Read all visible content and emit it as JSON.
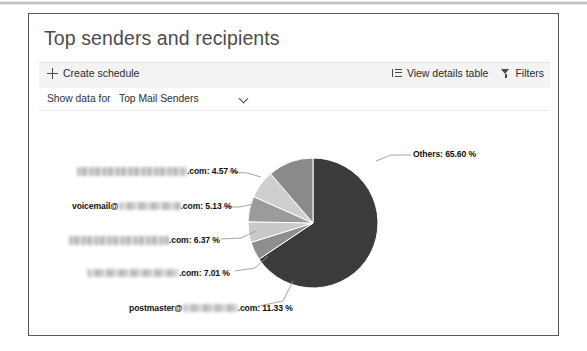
{
  "card": {
    "title": "Top senders and recipients"
  },
  "toolbar": {
    "create_schedule_label": "Create schedule",
    "view_details_label": "View details table",
    "filters_label": "Filters",
    "plus_icon": "plus-icon",
    "list_icon": "list-icon",
    "funnel_icon": "funnel-icon"
  },
  "filter_row": {
    "label": "Show data for",
    "selected": "Top Mail Senders",
    "chevron_icon": "chevron-down-icon",
    "options": [
      "Top Mail Senders"
    ]
  },
  "chart_data": {
    "type": "pie",
    "title": "Top senders and recipients",
    "legend": "labels-with-leader-lines",
    "grid": false,
    "categories": [
      "Others",
      "[redacted].com",
      "voicemail@[redacted].com",
      "[redacted].com",
      "[redacted].com",
      "postmaster@[redacted].com"
    ],
    "values": [
      65.6,
      4.57,
      5.13,
      6.37,
      7.01,
      11.33
    ],
    "labels": [
      "Others: 65.60 %",
      ".com: 4.57 %",
      ".com: 5.13 %",
      ".com: 6.37 %",
      ".com: 7.01 %",
      ".com: 11.33 %"
    ],
    "label_prefixes": [
      "",
      "",
      "voicemail@",
      "",
      "",
      "postmaster@"
    ],
    "redacted": [
      false,
      true,
      true,
      true,
      true,
      true
    ],
    "colors": [
      "#3b3b3b",
      "#8e8e8e",
      "#c9c9c9",
      "#9b9b9b",
      "#cfcfcf",
      "#8a8a8a"
    ],
    "units": "%"
  },
  "labels": {
    "others": "Others: 65.60 %",
    "row1_suffix": ".com: 4.57 %",
    "row2_prefix": "voicemail@",
    "row2_suffix": ".com: 5.13 %",
    "row3_suffix": ".com: 6.37 %",
    "row4_suffix": ".com: 7.01 %",
    "row5_prefix": "postmaster@",
    "row5_suffix": ".com: 11.33 %"
  }
}
